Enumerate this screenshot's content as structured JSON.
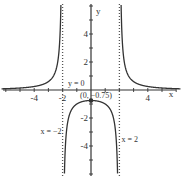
{
  "chart_data": {
    "type": "line",
    "title": "",
    "function": "y = 3/(x^2 - 4)",
    "xlabel": "x",
    "ylabel": "y",
    "xlim": [
      -6.5,
      6.5
    ],
    "ylim": [
      -6.3,
      6.3
    ],
    "x_ticks": [
      -4,
      -2,
      4
    ],
    "y_ticks": [
      4,
      2,
      -2,
      -4
    ],
    "x_tick_labels": [
      "-4",
      "-2",
      "4"
    ],
    "y_tick_labels": [
      "4",
      "2",
      "-2",
      "-4"
    ],
    "asymptotes": {
      "vertical": [
        {
          "x": -2,
          "label": "x = −2"
        },
        {
          "x": 2,
          "label": "x = 2"
        }
      ],
      "horizontal": [
        {
          "y": 0,
          "label": "y = 0"
        }
      ]
    },
    "points": [
      {
        "x": 0,
        "y": -0.75,
        "label": "(0, −0.75)"
      }
    ],
    "grid": false,
    "colors": {
      "curve": "#333333",
      "axis": "#333333",
      "asymptote": "#555555"
    }
  }
}
